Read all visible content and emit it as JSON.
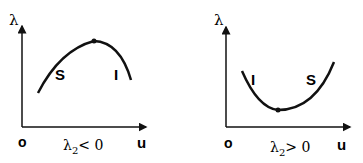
{
  "panels": [
    {
      "y_label": "λ",
      "x_label": "u",
      "origin_label": "o",
      "caption": "λ₂< 0",
      "caption_base": "λ",
      "caption_sub": "2",
      "caption_rel": "< 0",
      "branch_left": "S",
      "branch_right": "I",
      "curve_shape": "concave-down (maximum)"
    },
    {
      "y_label": "λ",
      "x_label": "u",
      "origin_label": "o",
      "caption": "λ₂> 0",
      "caption_base": "λ",
      "caption_sub": "2",
      "caption_rel": "> 0",
      "branch_left": "I",
      "branch_right": "S",
      "curve_shape": "concave-up (minimum)"
    }
  ],
  "colors": {
    "ink": "#111111",
    "background": "#ffffff"
  }
}
